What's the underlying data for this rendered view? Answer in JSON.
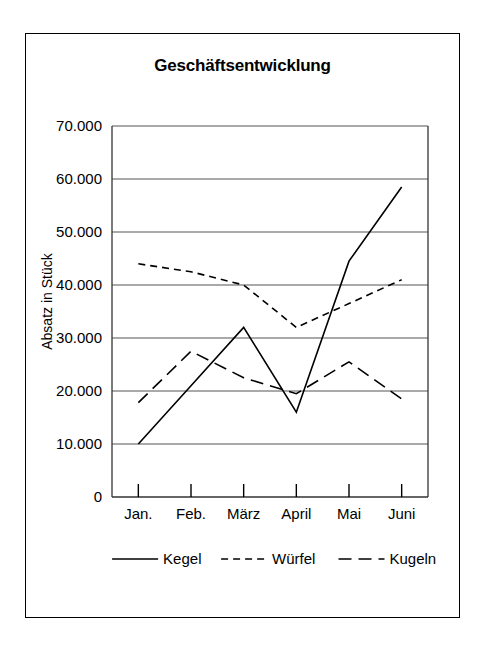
{
  "chart_data": {
    "type": "line",
    "title": "Geschäftsentwicklung",
    "xlabel": "",
    "ylabel": "Absatz in Stück",
    "categories": [
      "Jan.",
      "Feb.",
      "März",
      "April",
      "Mai",
      "Juni"
    ],
    "ylim": [
      0,
      70000
    ],
    "ytick_values": [
      0,
      10000,
      20000,
      30000,
      40000,
      50000,
      60000,
      70000
    ],
    "ytick_labels": [
      "0",
      "10.000",
      "20.000",
      "30.000",
      "40.000",
      "50.000",
      "60.000",
      "70.000"
    ],
    "grid": true,
    "legend_position": "bottom",
    "series": [
      {
        "name": "Kegel",
        "style": "solid",
        "values": [
          10000,
          21000,
          32000,
          16000,
          44500,
          58500
        ]
      },
      {
        "name": "Würfel",
        "style": "dashed-fine",
        "values": [
          44000,
          42500,
          40000,
          32000,
          36500,
          41000
        ]
      },
      {
        "name": "Kugeln",
        "style": "dashed-long",
        "values": [
          17800,
          27500,
          22500,
          19500,
          25500,
          18500
        ]
      }
    ]
  },
  "legend": {
    "items": [
      {
        "label": "Kegel"
      },
      {
        "label": "Würfel"
      },
      {
        "label": "Kugeln"
      }
    ]
  },
  "axes": {
    "y_title": "Absatz in Stück",
    "zero_label": "0"
  }
}
